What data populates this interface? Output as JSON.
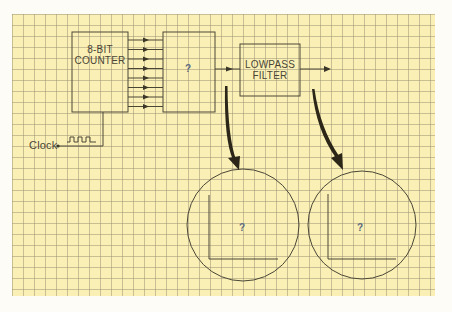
{
  "diagram": {
    "blocks": {
      "counter": {
        "line1": "8-BIT",
        "line2": "COUNTER"
      },
      "unknown_block": {
        "label": "?"
      },
      "filter": {
        "line1": "LOWPASS",
        "line2": "FILTER"
      }
    },
    "clock": {
      "label": "Clock"
    },
    "bus": {
      "line_count": 8
    },
    "scopes": [
      {
        "label": "?"
      },
      {
        "label": "?"
      }
    ],
    "colors": {
      "paper": "#faf0b6",
      "grid": "#a09678",
      "ink": "#4a4636",
      "arrow": "#2b2618",
      "question_mark": "#5d6a80"
    }
  }
}
